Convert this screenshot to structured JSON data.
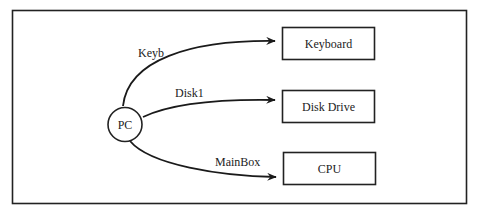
{
  "diagram": {
    "source_node": {
      "id": "pc",
      "label": "PC"
    },
    "target_nodes": [
      {
        "id": "keyboard",
        "label": "Keyboard"
      },
      {
        "id": "disk-drive",
        "label": "Disk Drive"
      },
      {
        "id": "cpu",
        "label": "CPU"
      }
    ],
    "edges": [
      {
        "from": "pc",
        "to": "keyboard",
        "label": "Keyb"
      },
      {
        "from": "pc",
        "to": "disk-drive",
        "label": "Disk1"
      },
      {
        "from": "pc",
        "to": "cpu",
        "label": "MainBox"
      }
    ]
  }
}
